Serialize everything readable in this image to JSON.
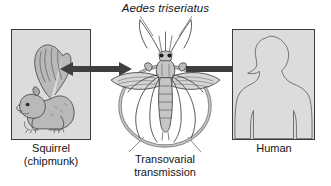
{
  "figure": {
    "species_title": "Aedes triseriatus",
    "background_color": "#ffffff",
    "panel_fill": "#dcdcdc",
    "panel_border": "#3a3a3a",
    "arrow_color": "#3f3f3f",
    "line_color": "#555555"
  },
  "panels": {
    "left": {
      "caption_line1": "Squirrel",
      "caption_line2": "(chipmunk)",
      "art": "squirrel-illustration"
    },
    "right": {
      "caption_line1": "Human",
      "caption_line2": "",
      "art": "human-silhouette-illustration"
    }
  },
  "center": {
    "art": "mosquito-illustration",
    "cycle_label_line1": "Transovarial",
    "cycle_label_line2": "transmission"
  },
  "arrows": {
    "left": {
      "name": "bidirectional-arrow",
      "direction": "both"
    },
    "right": {
      "name": "unidirectional-arrow",
      "direction": "right"
    }
  }
}
